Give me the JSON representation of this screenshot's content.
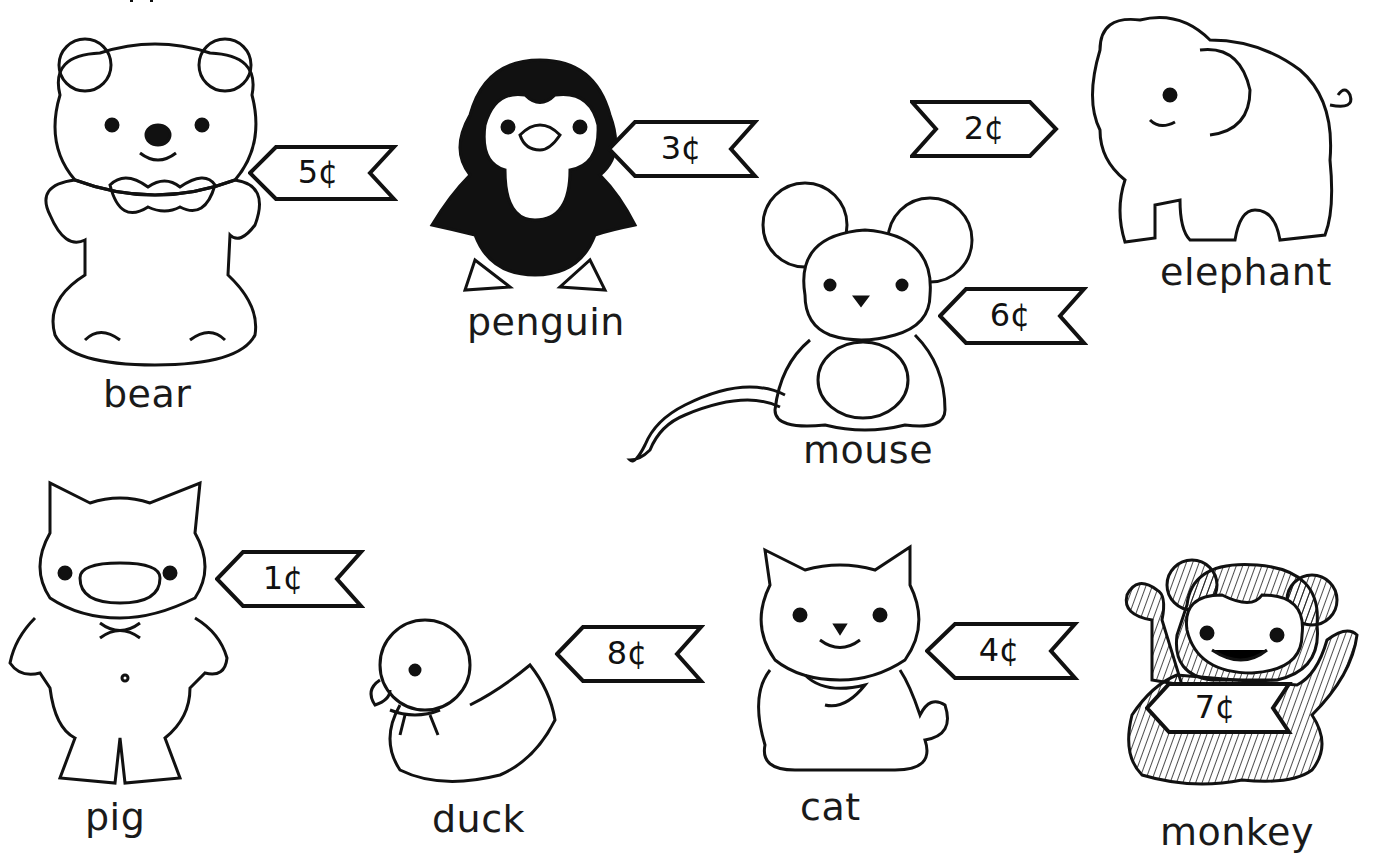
{
  "worksheet": {
    "colors": {
      "ink": "#111111",
      "paper": "#ffffff"
    },
    "toys": [
      {
        "name": "bear",
        "price": "5¢",
        "cents": 5
      },
      {
        "name": "penguin",
        "price": "3¢",
        "cents": 3
      },
      {
        "name": "elephant",
        "price": "2¢",
        "cents": 2
      },
      {
        "name": "mouse",
        "price": "6¢",
        "cents": 6
      },
      {
        "name": "pig",
        "price": "1¢",
        "cents": 1
      },
      {
        "name": "duck",
        "price": "8¢",
        "cents": 8
      },
      {
        "name": "cat",
        "price": "4¢",
        "cents": 4
      },
      {
        "name": "monkey",
        "price": "7¢",
        "cents": 7
      }
    ]
  }
}
